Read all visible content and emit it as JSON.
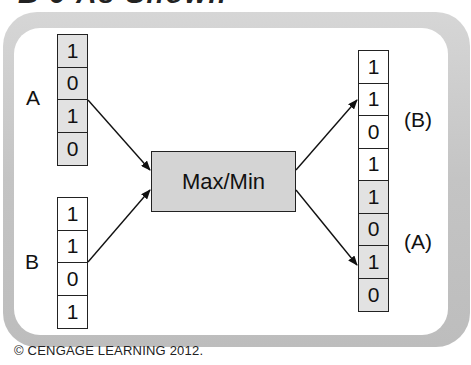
{
  "header": {
    "partial_title": "B 9 As Shown"
  },
  "diagram": {
    "input_a": {
      "label": "A",
      "bits": [
        "1",
        "0",
        "1",
        "0"
      ],
      "shade": "gray"
    },
    "input_b": {
      "label": "B",
      "bits": [
        "1",
        "1",
        "0",
        "1"
      ],
      "shade": "white"
    },
    "operator": {
      "label": "Max/Min"
    },
    "output": {
      "bits": [
        "1",
        "1",
        "0",
        "1",
        "1",
        "0",
        "1",
        "0"
      ],
      "shades": [
        "white",
        "white",
        "white",
        "white",
        "gray",
        "gray",
        "gray",
        "gray"
      ],
      "upper_label": "(B)",
      "lower_label": "(A)"
    },
    "colors": {
      "gray_cell": "#e2e2e2",
      "box_fill": "#d4d4d4",
      "frame": "#c6c6c6"
    }
  },
  "caption": "© CENGAGE LEARNING 2012."
}
